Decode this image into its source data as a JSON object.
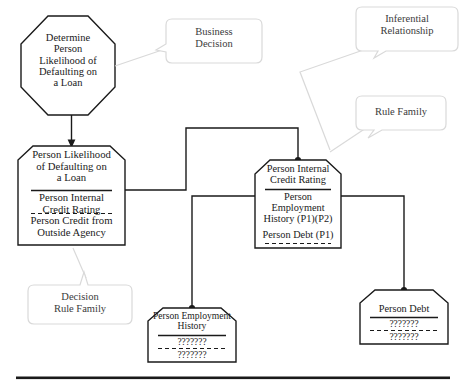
{
  "diagram": {
    "background_color": "#ffffff",
    "line_color": "#1a1a1a",
    "text_color": "#1a1a1a",
    "callout_line_color": "#d9d9d9",
    "callout_text_color": "#3b3b3b"
  },
  "nodes": {
    "decision_octagon": {
      "shape": "octagon",
      "label": "Determine\nPerson\nLikelihood of\nDefaulting on\na Loan"
    },
    "person_likelihood": {
      "shape": "clipped-box",
      "title": "Person Likelihood\nof Defaulting on\na Loan",
      "line_1": "Person Internal\nCredit Rating",
      "line_2": "Person Credit from\nOutside Agency"
    },
    "person_internal_credit_rating": {
      "shape": "clipped-box",
      "title": "Person Internal\nCredit Rating",
      "line_1": "Person\nEmployment\nHistory (P1)(P2)",
      "line_2": "Person Debt (P1)"
    },
    "person_employment_history": {
      "shape": "clipped-box",
      "title": "Person Employment\nHistory",
      "line_1": "???????",
      "line_2": "???????"
    },
    "person_debt": {
      "shape": "clipped-box",
      "title": "Person Debt",
      "line_1": "???????",
      "line_2": "???????"
    }
  },
  "callouts": {
    "business_decision": {
      "label": "Business\nDecision"
    },
    "inferential_relationship": {
      "label": "Inferential\nRelationship"
    },
    "rule_family": {
      "label": "Rule Family"
    },
    "decision_rule_family": {
      "label": "Decision\nRule Family"
    }
  }
}
